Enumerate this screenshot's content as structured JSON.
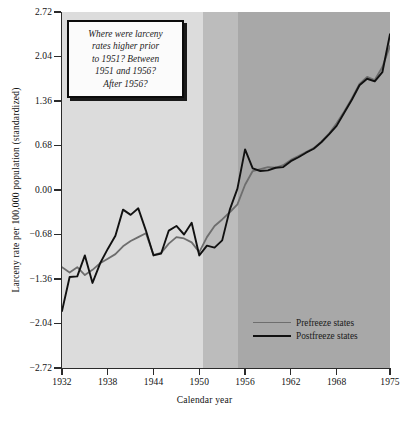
{
  "chart_data": {
    "type": "line",
    "title": "",
    "xlabel": "Calendar year",
    "ylabel": "Larceny rate per 100,000 population (standardized)",
    "xlim": [
      1932,
      1975
    ],
    "ylim": [
      -2.72,
      2.72
    ],
    "grid": false,
    "legend_position": "bottom-right",
    "xticks": [
      "1932",
      "1938",
      "1944",
      "1950",
      "1956",
      "1962",
      "1968",
      "1975"
    ],
    "xtick_values": [
      1932,
      1938,
      1944,
      1950,
      1956,
      1962,
      1968,
      1975
    ],
    "yticks": [
      "2.72",
      "2.04",
      "1.36",
      "0.68",
      "0.00",
      "-0.68",
      "-1.36",
      "-2.04",
      "-2.72"
    ],
    "ytick_values": [
      2.72,
      2.04,
      1.36,
      0.68,
      0.0,
      -0.68,
      -1.36,
      -2.04,
      -2.72
    ],
    "x": [
      1932,
      1933,
      1934,
      1935,
      1936,
      1937,
      1938,
      1939,
      1940,
      1941,
      1942,
      1943,
      1944,
      1945,
      1946,
      1947,
      1948,
      1949,
      1950,
      1951,
      1952,
      1953,
      1954,
      1955,
      1956,
      1957,
      1958,
      1959,
      1960,
      1961,
      1962,
      1963,
      1964,
      1965,
      1966,
      1967,
      1968,
      1969,
      1970,
      1971,
      1972,
      1973,
      1974,
      1975
    ],
    "series": [
      {
        "name": "Prefreeze states",
        "color": "#6e6e6e",
        "values": [
          -1.18,
          -1.26,
          -1.18,
          -1.3,
          -1.22,
          -1.12,
          -1.05,
          -0.98,
          -0.86,
          -0.78,
          -0.72,
          -0.66,
          -0.99,
          -0.96,
          -0.82,
          -0.72,
          -0.74,
          -0.8,
          -0.95,
          -0.72,
          -0.55,
          -0.45,
          -0.34,
          -0.22,
          0.08,
          0.29,
          0.32,
          0.35,
          0.34,
          0.38,
          0.46,
          0.52,
          0.58,
          0.64,
          0.74,
          0.86,
          1.02,
          1.2,
          1.4,
          1.62,
          1.73,
          1.68,
          1.88,
          2.2
        ]
      },
      {
        "name": "Postfreeze states",
        "color": "#111111",
        "values": [
          -1.85,
          -1.33,
          -1.32,
          -1.0,
          -1.42,
          -1.12,
          -0.9,
          -0.7,
          -0.3,
          -0.38,
          -0.28,
          -0.62,
          -1.0,
          -0.97,
          -0.62,
          -0.55,
          -0.68,
          -0.5,
          -1.0,
          -0.85,
          -0.88,
          -0.77,
          -0.3,
          0.02,
          0.62,
          0.33,
          0.29,
          0.3,
          0.34,
          0.35,
          0.44,
          0.5,
          0.57,
          0.63,
          0.73,
          0.85,
          0.98,
          1.18,
          1.38,
          1.6,
          1.7,
          1.66,
          1.8,
          2.38
        ]
      }
    ],
    "bands": [
      {
        "name": "prior-to-1951",
        "from": 1932,
        "to": 1950.5,
        "color": "#dcdcdc"
      },
      {
        "name": "1951-to-1956",
        "from": 1950.5,
        "to": 1955.1,
        "color": "#bcbcbc"
      },
      {
        "name": "after-1956",
        "from": 1955.1,
        "to": 1975,
        "color": "#a8a8a8"
      }
    ],
    "annotations": [
      {
        "name": "question-callout",
        "lines": [
          "Where were larceny",
          "rates higher prior",
          "to 1951? Between",
          "1951 and 1956?",
          "After 1956?"
        ]
      }
    ]
  }
}
